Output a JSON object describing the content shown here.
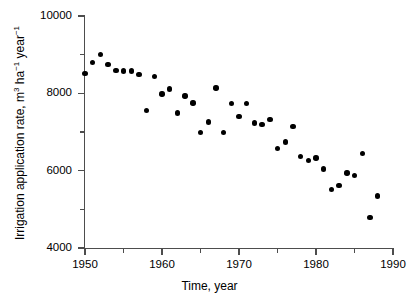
{
  "chart_data": {
    "type": "scatter",
    "title": "",
    "xlabel": "Time, year",
    "ylabel": "Irrigation application rate, m3 ha-1 year-1",
    "ylabel_parts": {
      "lead": "Irrigation application rate, m",
      "sup1": "3",
      "mid": " ha",
      "sup2": "−1",
      "mid2": " year",
      "sup3": "−1"
    },
    "xlim": [
      1950,
      1990
    ],
    "ylim": [
      4000,
      10000
    ],
    "grid": false,
    "legend": "none",
    "x_major_ticks": [
      1950,
      1960,
      1970,
      1980,
      1990
    ],
    "x_minor_ticks": [
      1955,
      1965,
      1975,
      1985
    ],
    "x_tick_labels": [
      "1950",
      "1960",
      "1970",
      "1980",
      "1990"
    ],
    "y_major_ticks": [
      4000,
      6000,
      8000,
      10000
    ],
    "y_minor_ticks": [
      5000,
      7000,
      9000
    ],
    "y_tick_labels": [
      "4000",
      "6000",
      "8000",
      "10000"
    ],
    "marker": "filled-circle",
    "marker_color": "#000000",
    "x": [
      1950,
      1951,
      1952,
      1953,
      1954,
      1955,
      1956,
      1957,
      1958,
      1959,
      1960,
      1961,
      1962,
      1963,
      1964,
      1965,
      1966,
      1967,
      1968,
      1969,
      1970,
      1971,
      1972,
      1973,
      1974,
      1975,
      1976,
      1977,
      1978,
      1979,
      1980,
      1981,
      1982,
      1983,
      1984,
      1985,
      1986,
      1987,
      1988
    ],
    "y": [
      8520,
      8800,
      9010,
      8740,
      8590,
      8580,
      8580,
      8490,
      7560,
      8430,
      7980,
      8110,
      7490,
      7930,
      7750,
      6980,
      7260,
      8140,
      6990,
      7740,
      7400,
      7730,
      7230,
      7200,
      7330,
      6570,
      6740,
      7140,
      6360,
      6260,
      6330,
      6040,
      5510,
      5880,
      5620,
      5940,
      5870,
      6440,
      4790,
      5350
    ],
    "points": [
      {
        "year": 1950,
        "value": 8520
      },
      {
        "year": 1951,
        "value": 8800
      },
      {
        "year": 1952,
        "value": 9010
      },
      {
        "year": 1953,
        "value": 8740
      },
      {
        "year": 1954,
        "value": 8590
      },
      {
        "year": 1955,
        "value": 8580
      },
      {
        "year": 1956,
        "value": 8580
      },
      {
        "year": 1957,
        "value": 8490
      },
      {
        "year": 1958,
        "value": 7560
      },
      {
        "year": 1959,
        "value": 8430
      },
      {
        "year": 1960,
        "value": 7980
      },
      {
        "year": 1961,
        "value": 8110
      },
      {
        "year": 1962,
        "value": 7490
      },
      {
        "year": 1963,
        "value": 7930
      },
      {
        "year": 1964,
        "value": 7750
      },
      {
        "year": 1965,
        "value": 6980
      },
      {
        "year": 1966,
        "value": 7260
      },
      {
        "year": 1967,
        "value": 8140
      },
      {
        "year": 1968,
        "value": 6990
      },
      {
        "year": 1969,
        "value": 7740
      },
      {
        "year": 1970,
        "value": 7400
      },
      {
        "year": 1971,
        "value": 7730
      },
      {
        "year": 1972,
        "value": 7230
      },
      {
        "year": 1973,
        "value": 7200
      },
      {
        "year": 1974,
        "value": 7330
      },
      {
        "year": 1975,
        "value": 6570
      },
      {
        "year": 1976,
        "value": 6740
      },
      {
        "year": 1977,
        "value": 7140
      },
      {
        "year": 1978,
        "value": 6360
      },
      {
        "year": 1979,
        "value": 6260
      },
      {
        "year": 1980,
        "value": 6330
      },
      {
        "year": 1981,
        "value": 6040
      },
      {
        "year": 1982,
        "value": 5510
      },
      {
        "year": 1983,
        "value": 5620
      },
      {
        "year": 1984,
        "value": 5940
      },
      {
        "year": 1985,
        "value": 5870
      },
      {
        "year": 1986,
        "value": 6440
      },
      {
        "year": 1987,
        "value": 4790
      },
      {
        "year": 1988,
        "value": 5350
      }
    ]
  }
}
